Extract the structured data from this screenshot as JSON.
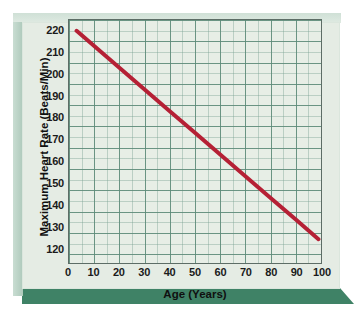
{
  "figure": {
    "panel_color": "#e5ece4",
    "base_color": "#3f8266",
    "frame_color": "#5d6d66",
    "grid_color": "#5c8a78",
    "line_color": "#b52035"
  },
  "chart_data": {
    "type": "line",
    "title": "",
    "xlabel": "Age (Years)",
    "ylabel": "Maximum Heart Rate (Beats/Min)",
    "xlim": [
      0,
      100
    ],
    "ylim": [
      113,
      225
    ],
    "xticks": [
      0,
      10,
      20,
      30,
      40,
      50,
      60,
      70,
      80,
      90,
      100
    ],
    "xtick_labels": [
      "0",
      "10",
      "20",
      "30",
      "40",
      "50",
      "60",
      "70",
      "80",
      "90",
      "100"
    ],
    "yticks": [
      120,
      130,
      140,
      150,
      160,
      170,
      180,
      190,
      200,
      210,
      220
    ],
    "ytick_labels": [
      "120",
      "130",
      "140",
      "150",
      "160",
      "170",
      "180",
      "190",
      "200",
      "210",
      "220"
    ],
    "grid": true,
    "grid_minor": true,
    "legend": "none",
    "series": [
      {
        "name": "Maximum Heart Rate",
        "color": "#b52035",
        "line_width": 4,
        "x": [
          3,
          10,
          20,
          30,
          40,
          50,
          60,
          70,
          80,
          90,
          99
        ],
        "values": [
          220,
          213,
          203,
          193,
          183,
          173,
          163,
          153,
          143,
          133,
          124
        ]
      }
    ]
  }
}
